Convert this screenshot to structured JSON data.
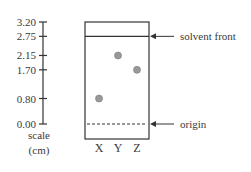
{
  "scale": {
    "ticks": [
      "3.20",
      "2.75",
      "2.15",
      "1.70",
      "0.80",
      "0.00"
    ],
    "tick_values": [
      3.2,
      2.75,
      2.15,
      1.7,
      0.8,
      0.0
    ],
    "label_line1": "scale",
    "label_line2": "(cm)"
  },
  "plate": {
    "solvent_front_cm": 2.75,
    "top_cm": 3.2,
    "origin_cm": 0.0,
    "lanes": [
      "X",
      "Y",
      "Z"
    ],
    "spots": [
      {
        "lane": "X",
        "distance_cm": 0.8
      },
      {
        "lane": "Y",
        "distance_cm": 2.15
      },
      {
        "lane": "Z",
        "distance_cm": 1.7
      }
    ],
    "spot_color": "#999999"
  },
  "annotations": {
    "solvent_front": "solvent front",
    "origin": "origin"
  }
}
